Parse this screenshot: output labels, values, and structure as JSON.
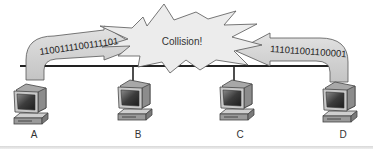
{
  "diagram": {
    "collision_label": "Collision!",
    "left_signal_bits": "1100111100111101",
    "right_signal_bits": "111011001100001",
    "nodes": [
      {
        "id": "A",
        "label": "A"
      },
      {
        "id": "B",
        "label": "B"
      },
      {
        "id": "C",
        "label": "C"
      },
      {
        "id": "D",
        "label": "D"
      }
    ],
    "colors": {
      "arrow_fill": "#d4d4d4",
      "arrow_stroke": "#555555",
      "burst_fill": "#ececec",
      "bus_line": "#222222",
      "monitor_body": "#bdbdbd",
      "screen": "#4a4a4a"
    }
  }
}
